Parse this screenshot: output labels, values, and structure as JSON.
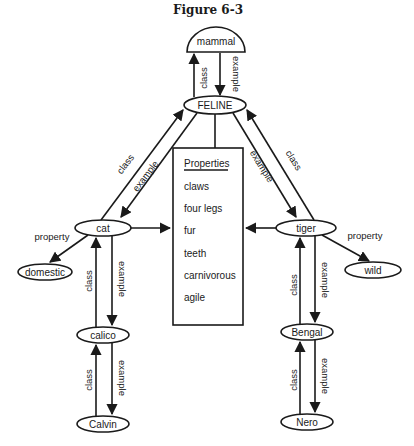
{
  "figure": {
    "title": "Figure 6-3"
  },
  "nodes": {
    "mammal": "mammal",
    "feline": "FELINE",
    "cat": "cat",
    "tiger": "tiger",
    "domestic": "domestic",
    "wild": "wild",
    "calico": "calico",
    "calvin": "Calvin",
    "bengal": "Bengal",
    "nero": "Nero"
  },
  "properties_box": {
    "heading": "Properties",
    "items": [
      "claws",
      "four legs",
      "fur",
      "teeth",
      "carnivorous",
      "agile"
    ]
  },
  "edge_labels": {
    "class": "class",
    "example": "example",
    "property": "property"
  },
  "colors": {
    "ink": "#1a1a1a",
    "background": "#ffffff"
  }
}
